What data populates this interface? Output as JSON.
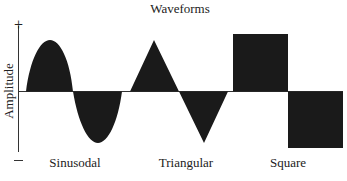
{
  "title": "Waveforms",
  "axis": {
    "ylabel": "Amplitude",
    "plus_label": "+",
    "minus_label": "−"
  },
  "waveforms": [
    {
      "name": "Sinusodal",
      "shape": "sine"
    },
    {
      "name": "Triangular",
      "shape": "triangle"
    },
    {
      "name": "Square",
      "shape": "square"
    }
  ],
  "colors": {
    "fill": "#1a1a1a",
    "line": "#333333",
    "background": "#ffffff"
  }
}
